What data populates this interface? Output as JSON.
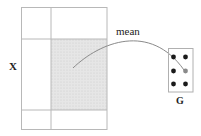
{
  "diagram": {
    "matrix_label": "X",
    "group_label": "G",
    "edge_label": "mean",
    "colors": {
      "grid_line": "#b8b8b8",
      "shade": "#e4e4e4",
      "shade_hatch": "#cfcfcf",
      "curve": "#888888",
      "dot": "#1a1a1a",
      "target_dot": "#8a8a8a",
      "box": "#b0b0b0"
    },
    "matrix": {
      "columns": 2,
      "rows": 3,
      "highlighted_cell": {
        "row": 1,
        "col": 1
      }
    },
    "group_nodes": {
      "rows": 3,
      "cols": 2,
      "target": {
        "row": 1,
        "col": 1
      }
    }
  }
}
